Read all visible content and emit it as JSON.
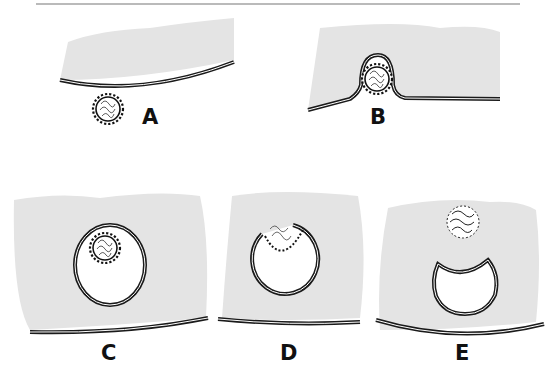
{
  "figure": {
    "top_rule": true,
    "colors": {
      "cytoplasm": "#e4e4e4",
      "membrane": "#1a1a1a",
      "background": "#ffffff"
    },
    "panels": [
      {
        "label": "A",
        "stage": "virus-attached-to-membrane"
      },
      {
        "label": "B",
        "stage": "membrane-invaginating-around-virus"
      },
      {
        "label": "C",
        "stage": "virus-in-endocytic-vesicle"
      },
      {
        "label": "D",
        "stage": "envelope-fusing-with-vesicle"
      },
      {
        "label": "E",
        "stage": "core-released-into-cytoplasm"
      }
    ]
  }
}
